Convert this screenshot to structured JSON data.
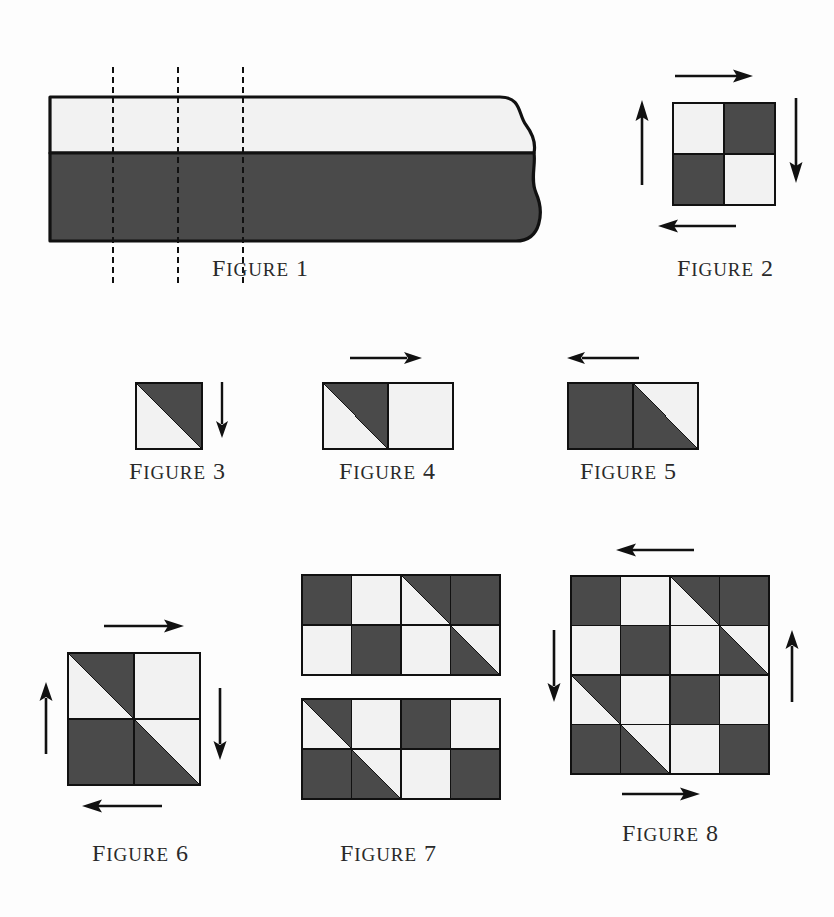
{
  "page": {
    "background": "#fdfdfd",
    "ink": "#111111",
    "dark_fill": "#4a4a4a",
    "light_fill": "#f2f2f2",
    "caption_prefix": "Figure"
  },
  "figures": [
    {
      "id": "figure-1",
      "caption_prefix": "Figure",
      "number": "1",
      "kind": "strip",
      "description": "Long two-tone paper strip with torn right edge and three dashed cut lines",
      "bands": [
        {
          "name": "upper-band",
          "shade": "light"
        },
        {
          "name": "lower-band",
          "shade": "dark"
        }
      ],
      "cut_lines": 3,
      "break_edge": "right"
    },
    {
      "id": "figure-2",
      "caption_prefix": "Figure",
      "number": "2",
      "kind": "grid",
      "cols": 2,
      "rows": 2,
      "cells": [
        [
          "light",
          "dark"
        ],
        [
          "dark",
          "light"
        ]
      ],
      "arrows": [
        {
          "name": "arrow-top",
          "direction": "right"
        },
        {
          "name": "arrow-right",
          "direction": "down"
        },
        {
          "name": "arrow-bottom",
          "direction": "left"
        },
        {
          "name": "arrow-left",
          "direction": "up"
        }
      ]
    },
    {
      "id": "figure-3",
      "caption_prefix": "Figure",
      "number": "3",
      "kind": "grid",
      "cols": 1,
      "rows": 1,
      "cells": [
        [
          "dia-ld"
        ]
      ],
      "arrows": [
        {
          "name": "arrow-right",
          "direction": "down"
        }
      ]
    },
    {
      "id": "figure-4",
      "caption_prefix": "Figure",
      "number": "4",
      "kind": "grid",
      "cols": 2,
      "rows": 1,
      "cells": [
        [
          "dia-ld",
          "light"
        ]
      ],
      "arrows": [
        {
          "name": "arrow-top",
          "direction": "right"
        }
      ]
    },
    {
      "id": "figure-5",
      "caption_prefix": "Figure",
      "number": "5",
      "kind": "grid",
      "cols": 2,
      "rows": 1,
      "cells": [
        [
          "dark",
          "dia-dl"
        ]
      ],
      "arrows": [
        {
          "name": "arrow-top",
          "direction": "left"
        }
      ]
    },
    {
      "id": "figure-6",
      "caption_prefix": "Figure",
      "number": "6",
      "kind": "grid",
      "cols": 2,
      "rows": 2,
      "cells": [
        [
          "dia-ld",
          "light"
        ],
        [
          "dark",
          "dia-dl"
        ]
      ],
      "arrows": [
        {
          "name": "arrow-top",
          "direction": "right"
        },
        {
          "name": "arrow-right",
          "direction": "down"
        },
        {
          "name": "arrow-bottom",
          "direction": "left"
        },
        {
          "name": "arrow-left",
          "direction": "up"
        }
      ]
    },
    {
      "id": "figure-7",
      "caption_prefix": "Figure",
      "number": "7",
      "kind": "grid-pair",
      "cols": 4,
      "rows": 2,
      "block_top": [
        [
          "dark",
          "light",
          "dia-ld",
          "dark"
        ],
        [
          "light",
          "dark",
          "light",
          "dia-dl"
        ]
      ],
      "block_bottom": [
        [
          "dia-ld",
          "light",
          "dark",
          "light"
        ],
        [
          "dark",
          "dia-dl",
          "light",
          "dark"
        ]
      ],
      "arrows": []
    },
    {
      "id": "figure-8",
      "caption_prefix": "Figure",
      "number": "8",
      "kind": "grid",
      "cols": 4,
      "rows": 4,
      "cells": [
        [
          "dark",
          "light",
          "dia-ld",
          "dark"
        ],
        [
          "light",
          "dark",
          "light",
          "dia-dl"
        ],
        [
          "dia-ld",
          "light",
          "dark",
          "light"
        ],
        [
          "dark",
          "dia-dl",
          "light",
          "dark"
        ]
      ],
      "arrows": [
        {
          "name": "arrow-top",
          "direction": "left"
        },
        {
          "name": "arrow-right",
          "direction": "up"
        },
        {
          "name": "arrow-bottom",
          "direction": "right"
        },
        {
          "name": "arrow-left",
          "direction": "down"
        }
      ]
    }
  ]
}
